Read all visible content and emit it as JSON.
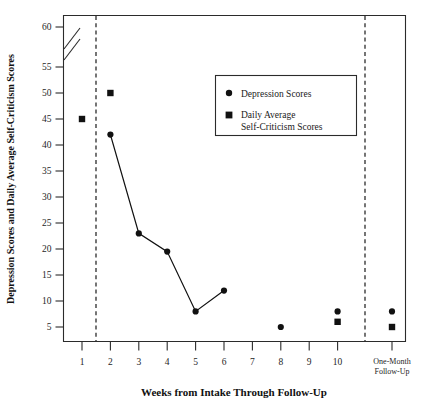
{
  "chart_data": {
    "type": "line",
    "title": "",
    "xlabel": "Weeks from Intake Through Follow-Up",
    "ylabel": "Depression Scores and Daily Average Self-Criticism Scores",
    "categories": [
      "1",
      "2",
      "3",
      "4",
      "5",
      "6",
      "7",
      "8",
      "9",
      "10",
      "One-Month Follow-Up"
    ],
    "xtick_labels": [
      "1",
      "2",
      "3",
      "4",
      "5",
      "6",
      "7",
      "8",
      "9",
      "10"
    ],
    "followup_tick_label_line1": "One-Month",
    "followup_tick_label_line2": "Follow-Up",
    "ylim": [
      0,
      62
    ],
    "ytick_labels": [
      "5",
      "10",
      "15",
      "20",
      "25",
      "30",
      "35",
      "40",
      "45",
      "50",
      "55",
      "60"
    ],
    "ytick_values": [
      5,
      10,
      15,
      20,
      25,
      30,
      35,
      40,
      45,
      50,
      55,
      60
    ],
    "axis_break": {
      "between": [
        55,
        60
      ],
      "style": "double-slash"
    },
    "grid": false,
    "legend_position": "upper-right",
    "series": [
      {
        "name": "Depression Scores",
        "marker": "circle",
        "connected": true,
        "points": [
          {
            "x": "2",
            "y": 42
          },
          {
            "x": "3",
            "y": 23
          },
          {
            "x": "4",
            "y": 19.5
          },
          {
            "x": "5",
            "y": 8
          },
          {
            "x": "6",
            "y": 12
          }
        ],
        "isolated_points": [
          {
            "x": "8",
            "y": 5
          },
          {
            "x": "10",
            "y": 8
          },
          {
            "x": "One-Month Follow-Up",
            "y": 8
          }
        ]
      },
      {
        "name": "Daily Average Self-Criticism Scores",
        "marker": "square",
        "connected": false,
        "points": [
          {
            "x": "1",
            "y": 45
          },
          {
            "x": "2",
            "y": 50
          },
          {
            "x": "10",
            "y": 6
          },
          {
            "x": "One-Month Follow-Up",
            "y": 5
          }
        ]
      }
    ],
    "phase_lines": [
      {
        "label": "",
        "position_between": [
          "1",
          "2"
        ]
      },
      {
        "label": "",
        "position_between": [
          "10",
          "One-Month Follow-Up"
        ]
      }
    ],
    "legend": [
      {
        "marker": "circle",
        "label_line1": "Depression Scores",
        "label_line2": ""
      },
      {
        "marker": "square",
        "label_line1": "Daily Average",
        "label_line2": "Self-Criticism Scores"
      }
    ],
    "colors": {
      "marker": "#111111",
      "line": "#111111",
      "axis": "#2b2b2b",
      "background": "#ffffff"
    }
  }
}
